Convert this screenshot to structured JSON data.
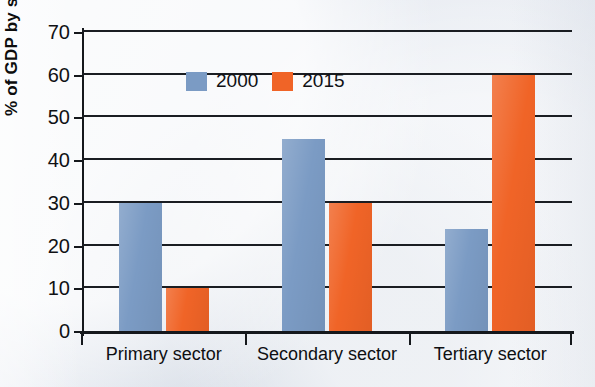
{
  "chart_data": {
    "type": "bar",
    "title": "",
    "xlabel": "",
    "ylabel": "% of GDP by sector",
    "ylim": [
      0,
      70
    ],
    "yticks": [
      0,
      10,
      20,
      30,
      40,
      50,
      60,
      70
    ],
    "ytick_labels": [
      "0",
      "10",
      "20",
      "30",
      "40",
      "50",
      "60",
      "70"
    ],
    "grid": true,
    "legend_position": "top-left-inside",
    "categories": [
      "Primary sector",
      "Secondary sector",
      "Tertiary sector"
    ],
    "series": [
      {
        "name": "2000",
        "color": "#7b9bc4",
        "values": [
          30,
          45,
          24
        ]
      },
      {
        "name": "2015",
        "color": "#f06427",
        "values": [
          10,
          30,
          60
        ]
      }
    ]
  },
  "colors": {
    "series_2000": "#7b9bc4",
    "series_2015": "#f06427",
    "background": "#e9edf3",
    "axis": "#15181c",
    "text": "#101114"
  }
}
